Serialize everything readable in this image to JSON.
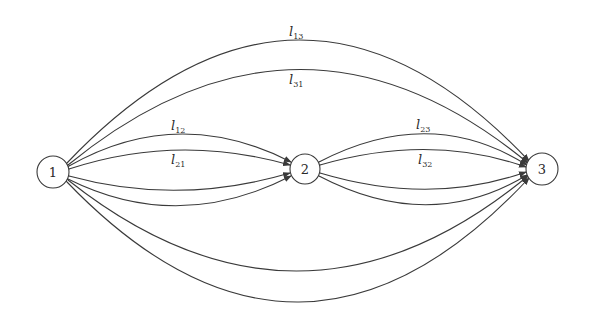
{
  "diagram": {
    "type": "directed-graph",
    "colors": {
      "stroke": "#3a3a3a",
      "text": "#2a2a2a",
      "background": "#ffffff"
    },
    "nodes": [
      {
        "id": "1",
        "label": "1",
        "cx": 53,
        "cy": 172,
        "r": 16
      },
      {
        "id": "2",
        "label": "2",
        "cx": 305,
        "cy": 169,
        "r": 15
      },
      {
        "id": "3",
        "label": "3",
        "cx": 542,
        "cy": 169,
        "r": 16
      }
    ],
    "edges": [
      {
        "id": "l13",
        "from": "1",
        "to": "3",
        "label": "l",
        "sub": "13",
        "label_x": 289,
        "label_y": 34
      },
      {
        "id": "l31",
        "from": "3",
        "to": "1",
        "label": "l",
        "sub": "31",
        "label_x": 289,
        "label_y": 82
      },
      {
        "id": "l12",
        "from": "1",
        "to": "2",
        "label": "l",
        "sub": "12",
        "label_x": 171,
        "label_y": 128
      },
      {
        "id": "l21",
        "from": "2",
        "to": "1",
        "label": "l",
        "sub": "21",
        "label_x": 171,
        "label_y": 163
      },
      {
        "id": "l23",
        "from": "2",
        "to": "3",
        "label": "l",
        "sub": "23",
        "label_x": 416,
        "label_y": 127
      },
      {
        "id": "l32",
        "from": "3",
        "to": "2",
        "label": "l",
        "sub": "32",
        "label_x": 418,
        "label_y": 163
      },
      {
        "id": "lower12a",
        "from": "2",
        "to": "1",
        "label": "",
        "sub": ""
      },
      {
        "id": "lower12b",
        "from": "2",
        "to": "1",
        "label": "",
        "sub": ""
      },
      {
        "id": "lower23a",
        "from": "2",
        "to": "3",
        "label": "",
        "sub": ""
      },
      {
        "id": "lower23b",
        "from": "2",
        "to": "3",
        "label": "",
        "sub": ""
      },
      {
        "id": "bottom13a",
        "from": "3",
        "to": "1",
        "label": "",
        "sub": ""
      },
      {
        "id": "bottom13b",
        "from": "3",
        "to": "1",
        "label": "",
        "sub": ""
      }
    ]
  }
}
